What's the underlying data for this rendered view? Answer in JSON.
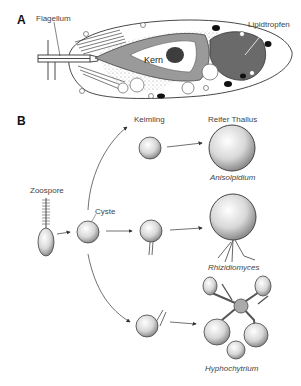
{
  "panel_a": {
    "letter": "A",
    "labels": {
      "flagellum": "Flagellum",
      "nucleus": "Kern",
      "lipid": "Lipidtropfen"
    }
  },
  "panel_b": {
    "letter": "B",
    "stages": {
      "zoospore": "Zoospore",
      "cyst": "Cyste",
      "germling": "Keimling",
      "mature": "Reifer Thallus"
    },
    "genera": [
      "Anisolpidium",
      "Rhizidiomyces",
      "Hyphochytrium"
    ]
  },
  "colors": {
    "line": "#333333",
    "lipid_fill": "#6a6a6a",
    "nucleus_ring": "#8a8a8a",
    "sphere_fill": "#e6e6e6"
  }
}
